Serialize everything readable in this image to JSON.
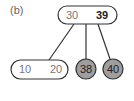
{
  "label": "(b)",
  "root": {
    "keys": [
      "30",
      "39"
    ]
  },
  "children": [
    {
      "type": "node",
      "keys": [
        "10",
        "20"
      ]
    },
    {
      "type": "leaf",
      "key": "38"
    },
    {
      "type": "leaf",
      "key": "40"
    }
  ],
  "colors": {
    "leaf_fill": "#9e9e9e",
    "stroke": "#333333"
  }
}
